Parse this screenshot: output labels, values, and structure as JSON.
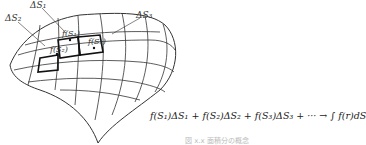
{
  "diagram": {
    "labels": {
      "dS1": "ΔS₁",
      "dS2": "ΔS₂",
      "dS3": "ΔS₃",
      "fS1": "f(S₁)",
      "fS2": "f(S₂)",
      "fS3": "f(S₃)"
    },
    "equation": "f(S₁)ΔS₁ + f(S₂)ΔS₂ + f(S₃)ΔS₃ + ··· → ∫ f(r)dS",
    "caption": "図 x.x  面積分の概念"
  }
}
